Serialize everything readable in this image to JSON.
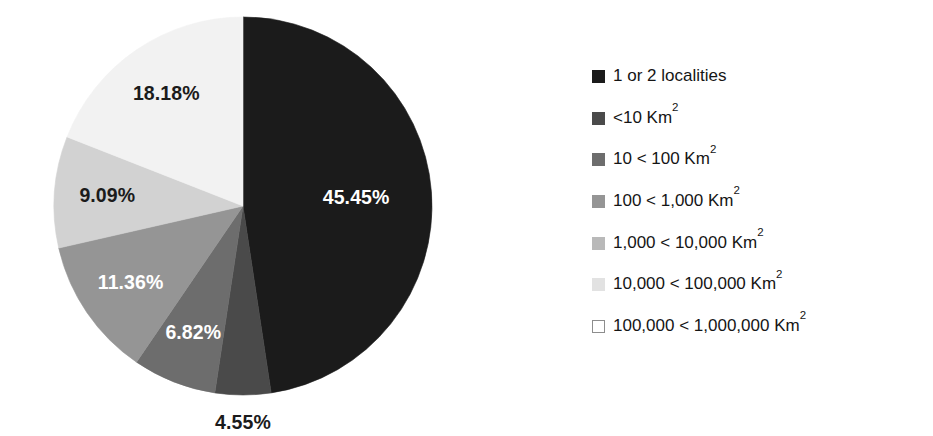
{
  "chart_data": {
    "type": "pie",
    "title": "",
    "subtitle": "",
    "xlabel": "",
    "ylabel": "",
    "grid": false,
    "legend_position": "right",
    "start_angle_clock": "12 o'clock",
    "direction": "clockwise",
    "value_unit": "percent",
    "categories": [
      "1 or 2 localities",
      "<10 Km²",
      "10 < 100 Km²",
      "100 < 1,000 Km²",
      "1,000 < 10,000 Km²",
      "10,000 < 100,000 Km²",
      "100,000 < 1,000,000 Km²"
    ],
    "values": [
      45.45,
      4.55,
      6.82,
      11.36,
      9.09,
      18.18,
      0
    ],
    "value_labels": [
      "45.45%",
      "4.55%",
      "6.82%",
      "11.36%",
      "9.09%",
      "18.18%",
      ""
    ],
    "colors": [
      "#1b1b1b",
      "#4a4a4a",
      "#6d6d6d",
      "#959595",
      "#d2d2d2",
      "#f2f2f2",
      "#ffffff"
    ],
    "slices": [
      {
        "label": "1 or 2 localities",
        "value": 45.45,
        "value_label": "45.45%",
        "color": "#1b1b1b",
        "label_color": "light",
        "label_placement": "inside"
      },
      {
        "label": "<10 Km²",
        "value": 4.55,
        "value_label": "4.55%",
        "color": "#4a4a4a",
        "label_color": "dark",
        "label_placement": "outside-bottom"
      },
      {
        "label": "10 < 100 Km²",
        "value": 6.82,
        "value_label": "6.82%",
        "color": "#6d6d6d",
        "label_color": "light",
        "label_placement": "inside"
      },
      {
        "label": "100 < 1,000 Km²",
        "value": 11.36,
        "value_label": "11.36%",
        "color": "#959595",
        "label_color": "light",
        "label_placement": "inside"
      },
      {
        "label": "1,000 < 10,000 Km²",
        "value": 9.09,
        "value_label": "9.09%",
        "color": "#d2d2d2",
        "label_color": "dark",
        "label_placement": "inside"
      },
      {
        "label": "10,000 < 100,000 Km²",
        "value": 18.18,
        "value_label": "18.18%",
        "color": "#f2f2f2",
        "label_color": "dark",
        "label_placement": "inside"
      },
      {
        "label": "100,000 < 1,000,000 Km²",
        "value": 0,
        "value_label": "",
        "color": "#ffffff",
        "label_color": "dark",
        "label_placement": "none"
      }
    ]
  },
  "legend": {
    "entries": [
      {
        "swatch": "#1b1b1b",
        "text": "1 or 2 localities",
        "sup": ""
      },
      {
        "swatch": "#4a4a4a",
        "text": "<10 Km",
        "sup": "2"
      },
      {
        "swatch": "#6d6d6d",
        "text": "10 < 100 Km",
        "sup": "2"
      },
      {
        "swatch": "#959595",
        "text": "100 < 1,000 Km",
        "sup": "2"
      },
      {
        "swatch": "#b9b9b9",
        "text": "1,000 < 10,000 Km",
        "sup": "2"
      },
      {
        "swatch": "#e2e2e2",
        "text": "10,000 < 100,000 Km",
        "sup": "2"
      },
      {
        "swatch": "#ffffff",
        "text": "100,000 < 1,000,000 Km",
        "sup": "2"
      }
    ]
  },
  "geometry": {
    "center_x": 243,
    "center_y": 206,
    "radius": 189
  }
}
